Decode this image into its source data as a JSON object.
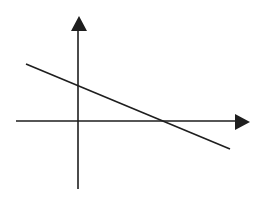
{
  "diagram": {
    "type": "coordinate-axes-with-line",
    "colors": {
      "background": "#ffffff",
      "stroke": "#1e1e1e"
    },
    "axes": {
      "origin": [
        78,
        121
      ],
      "x_axis": {
        "from": [
          16,
          121
        ],
        "to": [
          236,
          121
        ],
        "arrow_tip": [
          250,
          122
        ],
        "arrow_base_top": [
          235,
          114
        ],
        "arrow_base_bottom": [
          235,
          130
        ]
      },
      "y_axis": {
        "from": [
          78,
          189
        ],
        "to": [
          78,
          30
        ],
        "arrow_tip": [
          79,
          16
        ],
        "arrow_base_left": [
          71,
          31
        ],
        "arrow_base_right": [
          87,
          31
        ]
      }
    },
    "line": {
      "from": [
        26,
        64
      ],
      "to": [
        230,
        149
      ],
      "y_intercept_point": [
        78,
        85
      ],
      "x_intercept_point": [
        163,
        121
      ],
      "slope_sign": "negative"
    }
  }
}
